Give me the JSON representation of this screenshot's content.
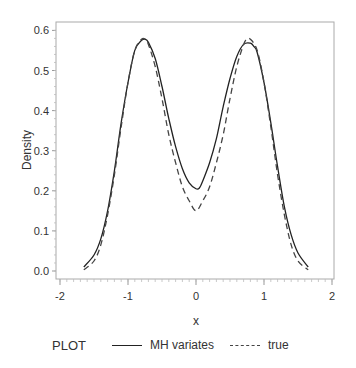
{
  "chart_data": {
    "type": "line",
    "title": "",
    "xlabel": "x",
    "ylabel": "Density",
    "xlim": [
      -2,
      2
    ],
    "ylim": [
      0.0,
      0.6
    ],
    "xticks": [
      "-2",
      "-1",
      "0",
      "1",
      "2"
    ],
    "yticks": [
      "0.0",
      "0.1",
      "0.2",
      "0.3",
      "0.4",
      "0.5",
      "0.6"
    ],
    "grid": false,
    "legend_position": "bottom",
    "legend_title": "PLOT",
    "series": [
      {
        "name": "MH variates",
        "style": "solid",
        "color": "#222222",
        "x": [
          -1.65,
          -1.5,
          -1.4,
          -1.3,
          -1.2,
          -1.1,
          -1.0,
          -0.9,
          -0.8,
          -0.75,
          -0.7,
          -0.6,
          -0.5,
          -0.4,
          -0.3,
          -0.2,
          -0.1,
          0.0,
          0.05,
          0.1,
          0.2,
          0.3,
          0.4,
          0.5,
          0.6,
          0.7,
          0.8,
          0.85,
          0.9,
          1.0,
          1.1,
          1.2,
          1.3,
          1.4,
          1.5,
          1.65
        ],
        "y": [
          0.01,
          0.04,
          0.08,
          0.15,
          0.25,
          0.37,
          0.47,
          0.55,
          0.575,
          0.578,
          0.57,
          0.53,
          0.46,
          0.38,
          0.31,
          0.255,
          0.22,
          0.205,
          0.207,
          0.225,
          0.27,
          0.33,
          0.41,
          0.48,
          0.535,
          0.565,
          0.568,
          0.56,
          0.545,
          0.47,
          0.37,
          0.26,
          0.16,
          0.09,
          0.045,
          0.01
        ]
      },
      {
        "name": "true",
        "style": "dashed",
        "color": "#444444",
        "x": [
          -1.65,
          -1.5,
          -1.4,
          -1.3,
          -1.2,
          -1.1,
          -1.0,
          -0.9,
          -0.8,
          -0.75,
          -0.7,
          -0.6,
          -0.5,
          -0.4,
          -0.3,
          -0.2,
          -0.1,
          0.0,
          0.1,
          0.2,
          0.3,
          0.4,
          0.5,
          0.6,
          0.7,
          0.75,
          0.8,
          0.9,
          1.0,
          1.1,
          1.2,
          1.3,
          1.4,
          1.5,
          1.65
        ],
        "y": [
          0.003,
          0.025,
          0.065,
          0.14,
          0.24,
          0.36,
          0.47,
          0.55,
          0.578,
          0.578,
          0.565,
          0.51,
          0.43,
          0.34,
          0.27,
          0.21,
          0.175,
          0.15,
          0.175,
          0.21,
          0.27,
          0.34,
          0.43,
          0.51,
          0.565,
          0.578,
          0.578,
          0.55,
          0.47,
          0.36,
          0.24,
          0.14,
          0.065,
          0.025,
          0.003
        ]
      }
    ]
  },
  "legend": {
    "title": "PLOT",
    "items": [
      {
        "label": "MH variates",
        "style": "solid"
      },
      {
        "label": "true",
        "style": "dashed"
      }
    ]
  },
  "axes": {
    "xlabel": "x",
    "ylabel": "Density"
  }
}
